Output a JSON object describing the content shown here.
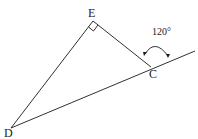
{
  "figure": {
    "type": "geometry-diagram",
    "cropped_header_text": "",
    "points": {
      "E": {
        "label": "E",
        "x": 93,
        "y": 21
      },
      "C": {
        "label": "C",
        "x": 151,
        "y": 67
      },
      "D": {
        "label": "D",
        "x": 11,
        "y": 128
      }
    },
    "extension_end": {
      "x": 195,
      "y": 51
    },
    "right_angle_at": "E",
    "angle_label": "120°",
    "colors": {
      "line": "#1a1a1a",
      "background": "#ffffff"
    }
  }
}
